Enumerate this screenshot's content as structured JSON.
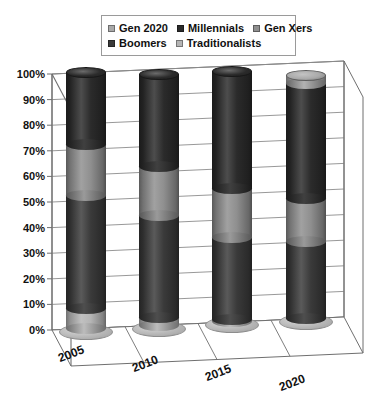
{
  "chart_data": {
    "type": "bar",
    "subtype": "stacked-cylinder-3d",
    "title": "",
    "xlabel": "",
    "ylabel": "",
    "categories": [
      "2005",
      "2010",
      "2015",
      "2020"
    ],
    "ylim": [
      0,
      100
    ],
    "ytick_labels": [
      "0%",
      "10%",
      "20%",
      "30%",
      "40%",
      "50%",
      "60%",
      "70%",
      "80%",
      "90%",
      "100%"
    ],
    "ytick_values": [
      0,
      10,
      20,
      30,
      40,
      50,
      60,
      70,
      80,
      90,
      100
    ],
    "grid": true,
    "legend_position": "top",
    "stack_order_bottom_to_top": [
      "Traditionalists",
      "Boomers",
      "Gen Xers",
      "Millennials",
      "Gen 2020"
    ],
    "series": [
      {
        "name": "Gen 2020",
        "color": "#a9a9a9",
        "values": [
          0,
          0,
          0,
          3
        ]
      },
      {
        "name": "Millennials",
        "color": "#2b2b2b",
        "values": [
          28,
          36,
          46,
          45
        ]
      },
      {
        "name": "Gen Xers",
        "color": "#8f8f8f",
        "values": [
          20,
          19,
          19,
          17
        ]
      },
      {
        "name": "Boomers",
        "color": "#3a3a3a",
        "values": [
          44,
          40,
          32,
          30
        ]
      },
      {
        "name": "Traditionalists",
        "color": "#b5b5b5",
        "values": [
          8,
          3,
          1,
          0
        ]
      }
    ],
    "column_totals": [
      100,
      98,
      98,
      95
    ]
  },
  "legend": {
    "rows": [
      [
        {
          "label": "Gen 2020",
          "color": "#a9a9a9"
        },
        {
          "label": "Millennials",
          "color": "#2b2b2b"
        },
        {
          "label": "Gen Xers",
          "color": "#8f8f8f"
        }
      ],
      [
        {
          "label": "Boomers",
          "color": "#3a3a3a"
        },
        {
          "label": "Traditionalists",
          "color": "#b5b5b5"
        }
      ]
    ]
  },
  "axes": {
    "y_labels": [
      "100%",
      "90%",
      "80%",
      "70%",
      "60%",
      "50%",
      "40%",
      "30%",
      "20%",
      "10%",
      "0%"
    ],
    "x_labels": [
      "2005",
      "2010",
      "2015",
      "2020"
    ]
  },
  "colors": {
    "grid_line": "#8c8c8c",
    "axis_line": "#6f6f6f",
    "background": "#ffffff",
    "text": "#111111"
  }
}
